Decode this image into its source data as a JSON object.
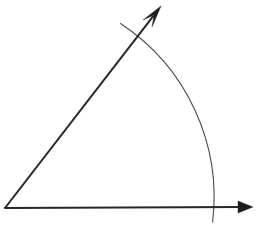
{
  "figure": {
    "name": "angle-with-arc-diagram",
    "background_color": "#ffffff",
    "width": 271,
    "height": 236,
    "vertex": {
      "x": 5,
      "y": 208,
      "label": ""
    },
    "stroke_color_rays": "#262626",
    "stroke_color_arc": "#4a4a4a",
    "ray_width": 2.0,
    "arc_width": 1.1
  },
  "rays": [
    {
      "name": "horizontal-ray",
      "from_x": 5,
      "from_y": 208,
      "to_x": 253,
      "to_y": 207,
      "angle_degrees": 0,
      "arrowhead": "solid-triangle",
      "arrow_tip_x": 253,
      "arrow_tip_y": 207,
      "arrow_length": 15,
      "arrow_half_width": 6,
      "color": "#262626"
    },
    {
      "name": "diagonal-ray",
      "from_x": 5,
      "from_y": 208,
      "to_x": 160,
      "to_y": 7,
      "angle_degrees": 52.3,
      "arrowhead": "barbed-arrow",
      "arrow_tip_x": 161,
      "arrow_tip_y": 6,
      "arrow_length": 22,
      "arrow_half_width": 6,
      "color": "#262626"
    }
  ],
  "arc": {
    "name": "angle-arc",
    "center_x": 5,
    "center_y": 208,
    "radius": 208,
    "start_x": 212.6,
    "start_y": 222.0,
    "end_x": 120.5,
    "end_y": 23.5,
    "start_angle_degrees": -3.9,
    "end_angle_degrees": 62.6,
    "sweep_degrees": 66.5,
    "color": "#4a4a4a",
    "overshoots_both_rays": true
  },
  "intersections": [
    {
      "name": "arc-horizontal-crossing",
      "x": 212,
      "y": 208
    },
    {
      "name": "arc-diagonal-crossing",
      "x": 136,
      "y": 39
    }
  ],
  "labels": []
}
